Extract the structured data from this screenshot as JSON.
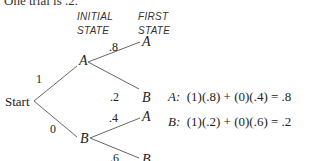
{
  "intro_text_partial": "One trial is .2.",
  "headers": {
    "initial_state": [
      "Initial",
      "State"
    ],
    "first_state": [
      "First",
      "State"
    ]
  },
  "tree": {
    "root": "Start",
    "initial_nodes": [
      {
        "label": "A",
        "prob": "1"
      },
      {
        "label": "B",
        "prob": "0"
      }
    ],
    "branches": {
      "A": [
        {
          "label": "A",
          "prob": ".8"
        },
        {
          "label": "B",
          "prob": ".2"
        }
      ],
      "B": [
        {
          "label": "A",
          "prob": ".4"
        },
        {
          "label": "B",
          "prob": ".6"
        }
      ]
    }
  },
  "equations": [
    {
      "state": "A:",
      "expr": "(1)(.8) + (0)(.4) = .8"
    },
    {
      "state": "B:",
      "expr": "(1)(.2) + (0)(.6) = .2"
    }
  ],
  "colors": {
    "line": "#444444",
    "text": "#222222"
  }
}
